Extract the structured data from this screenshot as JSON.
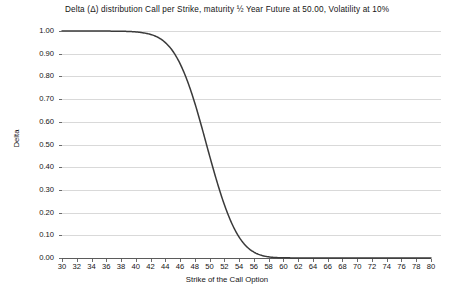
{
  "chart_data": {
    "type": "line",
    "title": "Delta (Δ) distribution Call per Strike, maturity ½  Year Future at 50.00, Volatility at 10%",
    "xlabel": "Strike of the Call Option",
    "ylabel": "Delta",
    "xlim": [
      30,
      80
    ],
    "ylim": [
      0.0,
      1.0
    ],
    "grid": true,
    "legend_position": "none",
    "series_color": "#3a3a3a",
    "grid_color": "#d9d9d9",
    "axis_color": "#5b5b5b",
    "xticks": [
      30,
      32,
      34,
      36,
      38,
      40,
      42,
      44,
      46,
      48,
      50,
      52,
      54,
      56,
      58,
      60,
      62,
      64,
      66,
      68,
      70,
      72,
      74,
      76,
      78,
      80
    ],
    "yticks": [
      "0.00",
      "0.10",
      "0.20",
      "0.30",
      "0.40",
      "0.50",
      "0.60",
      "0.70",
      "0.80",
      "0.90",
      "1.00"
    ],
    "series": [
      {
        "name": "Delta",
        "x": [
          30,
          31,
          32,
          33,
          34,
          35,
          36,
          37,
          38,
          39,
          40,
          41,
          42,
          43,
          44,
          45,
          46,
          47,
          48,
          49,
          50,
          51,
          52,
          53,
          54,
          55,
          56,
          57,
          58,
          59,
          60,
          61,
          62,
          64,
          66,
          68,
          70,
          72,
          74,
          76,
          78,
          80
        ],
        "values": [
          1.0,
          1.0,
          1.0,
          1.0,
          1.0,
          1.0,
          1.0,
          0.999,
          0.999,
          0.998,
          0.996,
          0.992,
          0.985,
          0.972,
          0.949,
          0.912,
          0.856,
          0.779,
          0.682,
          0.569,
          0.45,
          0.336,
          0.235,
          0.153,
          0.092,
          0.051,
          0.026,
          0.012,
          0.005,
          0.002,
          0.001,
          0.0005,
          0.0002,
          0.0,
          0.0,
          0.0,
          0.0,
          0.0,
          0.0,
          0.0,
          0.0,
          0.0
        ]
      }
    ]
  }
}
